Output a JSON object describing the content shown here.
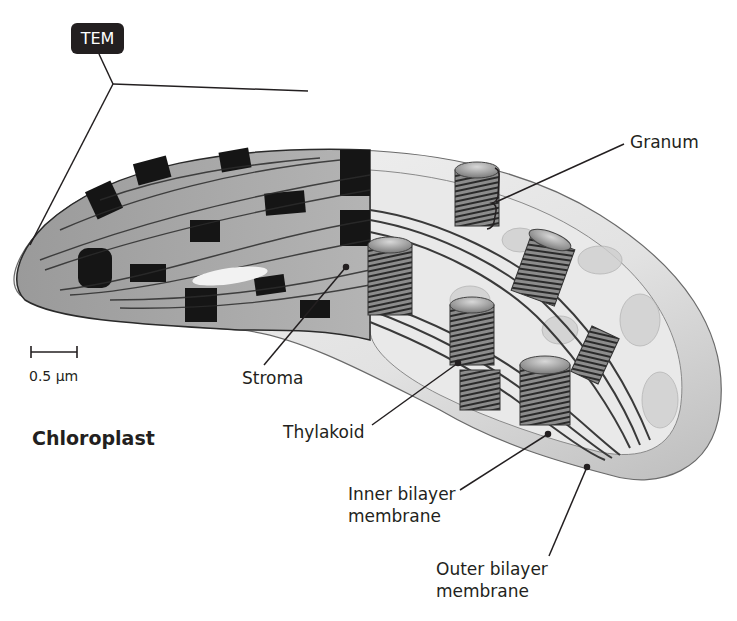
{
  "diagram": {
    "title": "Chloroplast",
    "badge": "TEM",
    "scale_bar": "0.5 µm",
    "labels": {
      "granum": "Granum",
      "stroma": "Stroma",
      "thylakoid": "Thylakoid",
      "inner_membrane_line1": "Inner bilayer",
      "inner_membrane_line2": "membrane",
      "outer_membrane_line1": "Outer bilayer",
      "outer_membrane_line2": "membrane"
    },
    "colors": {
      "text": "#231f20",
      "badge_bg": "#231f20",
      "tem_dark": "#1a1a1a",
      "tem_light": "#b8b8b8",
      "illustration_fill": "#e6e6e6"
    }
  }
}
